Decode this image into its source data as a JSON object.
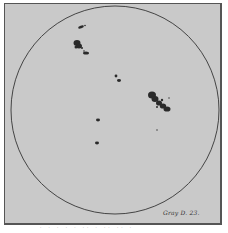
{
  "figure": {
    "signature": "Gray D. 23.",
    "caption": "· · · ·  ·  ·· ·  ·· ··  ·",
    "colors": {
      "background": "#c9c9c9",
      "frame": "#555555",
      "limb": "#444444",
      "spot": "#2a2a2a"
    },
    "disk": {
      "cx": 115,
      "cy": 110,
      "r": 104
    },
    "spot_groups": [
      {
        "name": "north-small-group",
        "x": 83,
        "y": 27
      },
      {
        "name": "northwest-large-group",
        "x": 80,
        "y": 48
      },
      {
        "name": "center-pair",
        "x": 118,
        "y": 79
      },
      {
        "name": "east-large-group",
        "x": 160,
        "y": 104
      },
      {
        "name": "east-single-spot",
        "x": 157,
        "y": 130
      },
      {
        "name": "south-spot-upper",
        "x": 98,
        "y": 120
      },
      {
        "name": "south-spot-lower",
        "x": 97,
        "y": 143
      }
    ]
  }
}
